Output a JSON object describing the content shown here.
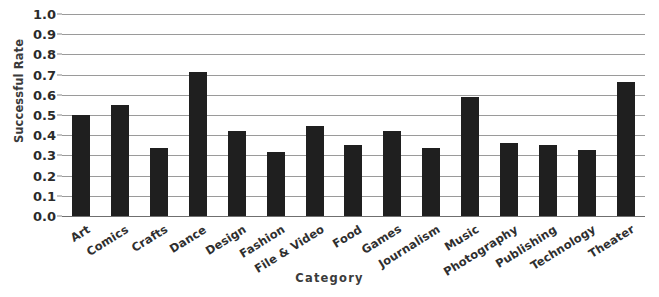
{
  "chart_data": {
    "type": "bar",
    "title": "",
    "subtitle": "",
    "xlabel": "Category",
    "ylabel": "Successful Rate",
    "ylim": [
      0.0,
      1.0
    ],
    "ytick_labels": [
      "1.0",
      "0.9",
      "0.8",
      "0.7",
      "0.6",
      "0.5",
      "0.4",
      "0.3",
      "0.2",
      "0.1",
      "0.0"
    ],
    "ytick_values": [
      1.0,
      0.9,
      0.8,
      0.7,
      0.6,
      0.5,
      0.4,
      0.3,
      0.2,
      0.1,
      0.0
    ],
    "grid": true,
    "legend": null,
    "bar_color": "#1f1f1f",
    "gridline_color": "#9a9a9a",
    "categories": [
      "Art",
      "Comics",
      "Crafts",
      "Dance",
      "Design",
      "Fashion",
      "File & Video",
      "Food",
      "Games",
      "Journalism",
      "Music",
      "Photography",
      "Publishing",
      "Technology",
      "Theater"
    ],
    "values": [
      0.5,
      0.55,
      0.335,
      0.715,
      0.42,
      0.315,
      0.445,
      0.35,
      0.42,
      0.335,
      0.59,
      0.36,
      0.35,
      0.325,
      0.665
    ]
  }
}
